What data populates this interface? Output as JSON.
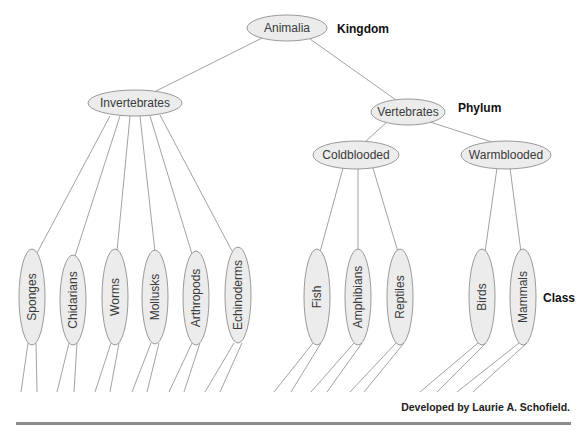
{
  "diagram": {
    "rank_labels": {
      "kingdom": "Kingdom",
      "phylum": "Phylum",
      "class": "Class"
    },
    "kingdom": {
      "label": "Animalia"
    },
    "phyla": [
      {
        "label": "Invertebrates"
      },
      {
        "label": "Vertebrates"
      }
    ],
    "vertebrate_groups": [
      {
        "label": "Coldblooded"
      },
      {
        "label": "Warmblooded"
      }
    ],
    "classes": {
      "invertebrates": [
        {
          "label": "Sponges"
        },
        {
          "label": "Chidarians"
        },
        {
          "label": "Worms"
        },
        {
          "label": "Mollusks"
        },
        {
          "label": "Arthropods"
        },
        {
          "label": "Echinoderms"
        }
      ],
      "coldblooded": [
        {
          "label": "Fish"
        },
        {
          "label": "Amphibians"
        },
        {
          "label": "Reptiles"
        }
      ],
      "warmblooded": [
        {
          "label": "Birds"
        },
        {
          "label": "Mammals"
        }
      ]
    },
    "colors": {
      "node_fill": "#ececec",
      "node_stroke": "#8e8e8e",
      "edge": "#8a8a8a",
      "rule": "#8c8c8c"
    }
  },
  "footer": {
    "credit": "Developed by Laurie A. Schofield."
  }
}
